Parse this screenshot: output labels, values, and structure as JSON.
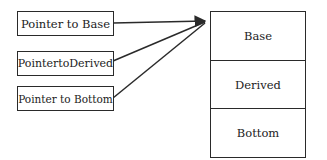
{
  "pointers": [
    {
      "label": "Pointer to Base"
    },
    {
      "label": "PointertoDerived"
    },
    {
      "label": "Pointer to Bottom"
    }
  ],
  "object_layout": [
    {
      "label": "Base"
    },
    {
      "label": "Derived"
    },
    {
      "label": "Bottom"
    }
  ]
}
